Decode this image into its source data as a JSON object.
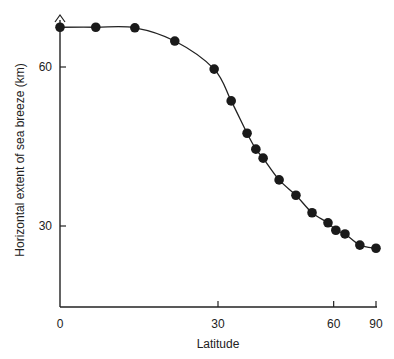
{
  "chart_data": {
    "type": "scatter",
    "title": "",
    "xlabel": "Latitude",
    "ylabel": "Horizontal extent of sea breeze (km)",
    "x_scale": "sine",
    "xlim": [
      0,
      90
    ],
    "ylim": [
      14.5,
      68.5
    ],
    "xticks": [
      0,
      30,
      60,
      90
    ],
    "yticks": [
      30,
      60
    ],
    "grid": false,
    "legend": null,
    "series": [
      {
        "name": "observations",
        "marker": "filled-circle",
        "smooth_curve": true,
        "x": [
          0,
          6.5,
          13.7,
          21.3,
          29.2,
          32.8,
          36.3,
          38.3,
          40.0,
          43.9,
          48.3,
          52.9,
          58.0,
          60.8,
          64.4,
          71.6,
          90
        ],
        "y": [
          67.5,
          67.5,
          67.4,
          64.9,
          59.6,
          53.6,
          47.5,
          44.5,
          42.8,
          38.7,
          35.8,
          32.5,
          30.6,
          29.2,
          28.5,
          26.4,
          25.8
        ]
      }
    ]
  },
  "axes": {
    "x_label": "Latitude",
    "y_label": "Horizontal extent of sea breeze (km)",
    "x_ticks": [
      "0",
      "30",
      "60",
      "90"
    ],
    "y_ticks": [
      "60",
      "30"
    ]
  }
}
